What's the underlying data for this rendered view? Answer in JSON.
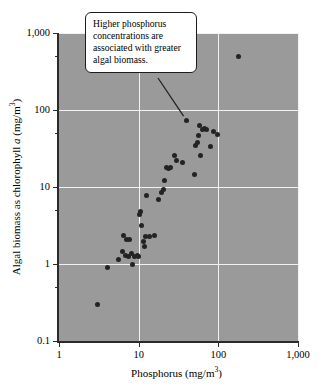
{
  "chart_data": {
    "type": "scatter",
    "title": "",
    "xlabel": "Phosphorus (mg/m3)",
    "ylabel": "Algal biomass as chlorophyll a (mg/m3)",
    "xscale": "log",
    "yscale": "log",
    "xlim": [
      1,
      1000
    ],
    "ylim": [
      0.1,
      1000
    ],
    "grid": true,
    "legend": null,
    "x_ticks": [
      {
        "value": 1,
        "label": "1"
      },
      {
        "value": 10,
        "label": "10"
      },
      {
        "value": 100,
        "label": "100"
      },
      {
        "value": 1000,
        "label": "1,000"
      }
    ],
    "y_ticks": [
      {
        "value": 0.1,
        "label": "0.1"
      },
      {
        "value": 1,
        "label": "1"
      },
      {
        "value": 10,
        "label": "10"
      },
      {
        "value": 100,
        "label": "100"
      },
      {
        "value": 1000,
        "label": "1,000"
      }
    ],
    "marker": {
      "shape": "circle",
      "color": "#232323",
      "size_px": 5
    },
    "plot_background": "#9a9a9a",
    "gridline_color": "#f2f2f2",
    "axis_color": "#2b2b2b",
    "points": [
      [
        3.0,
        0.3
      ],
      [
        4.1,
        0.9
      ],
      [
        5.6,
        1.15
      ],
      [
        6.2,
        1.45
      ],
      [
        6.5,
        2.35
      ],
      [
        6.8,
        1.3
      ],
      [
        7.0,
        2.05
      ],
      [
        7.4,
        1.25
      ],
      [
        7.7,
        2.1
      ],
      [
        8.2,
        1.35
      ],
      [
        8.4,
        1.0
      ],
      [
        8.9,
        1.25
      ],
      [
        9.6,
        1.3
      ],
      [
        9.9,
        1.25
      ],
      [
        10.2,
        4.45
      ],
      [
        10.6,
        4.8
      ],
      [
        10.9,
        3.2
      ],
      [
        11.6,
        1.95
      ],
      [
        12.0,
        1.7
      ],
      [
        12.3,
        2.25
      ],
      [
        12.6,
        7.8
      ],
      [
        13.8,
        2.25
      ],
      [
        16.0,
        2.35
      ],
      [
        17.5,
        6.8
      ],
      [
        19.5,
        8.6
      ],
      [
        20.5,
        9.4
      ],
      [
        21.0,
        12.0
      ],
      [
        22.5,
        18.0
      ],
      [
        23.5,
        17.5
      ],
      [
        25.0,
        18.0
      ],
      [
        28.0,
        26.0
      ],
      [
        30.0,
        22.0
      ],
      [
        36.0,
        21.0
      ],
      [
        40.0,
        74.0
      ],
      [
        50.0,
        14.5
      ],
      [
        52.0,
        35.0
      ],
      [
        55.0,
        38.0
      ],
      [
        56.0,
        47.0
      ],
      [
        58.0,
        63.0
      ],
      [
        60.0,
        26.0
      ],
      [
        64.0,
        55.0
      ],
      [
        68.0,
        57.0
      ],
      [
        72.0,
        56.0
      ],
      [
        80.0,
        34.0
      ],
      [
        86.0,
        52.0
      ],
      [
        98.0,
        48.0
      ],
      [
        180.0,
        500.0
      ]
    ],
    "annotations": [
      {
        "text": "Higher phosphorus concentrations are associated with greater algal biomass.",
        "target_point": [
          40.0,
          74.0
        ],
        "style": "callout-box-with-leader-line"
      }
    ]
  },
  "axes": {
    "x_title_main": "Phosphorus (mg/m",
    "x_title_sup": "3",
    "x_title_tail": ")",
    "y_title_pre": "Algal biomass as chlorophyll ",
    "y_title_italic": "a",
    "y_title_mid": " (mg/m",
    "y_title_sup": "3",
    "y_title_tail": ")"
  },
  "callout": {
    "line1": "Higher phosphorus",
    "line2": "concentrations are",
    "line3": "associated with greater",
    "line4": "algal biomass."
  }
}
